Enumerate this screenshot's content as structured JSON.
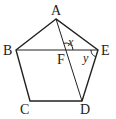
{
  "diagram": {
    "type": "geometry",
    "shape": "pentagon",
    "vertices": [
      {
        "label": "A",
        "x": 56,
        "y": 19
      },
      {
        "label": "B",
        "x": 16,
        "y": 50
      },
      {
        "label": "C",
        "x": 30,
        "y": 101
      },
      {
        "label": "D",
        "x": 82,
        "y": 101
      },
      {
        "label": "E",
        "x": 98,
        "y": 50
      }
    ],
    "intersection": {
      "label": "F",
      "x": 66,
      "y": 50
    },
    "segments": [
      "AB",
      "BC",
      "CD",
      "DE",
      "EA",
      "BE",
      "AD"
    ],
    "angles": [
      {
        "label": "x",
        "at": "F",
        "between": [
          "FA",
          "FE"
        ]
      },
      {
        "label": "y",
        "at": "E",
        "between": [
          "EB",
          "ED"
        ]
      }
    ]
  },
  "labels": {
    "A": "A",
    "B": "B",
    "C": "C",
    "D": "D",
    "E": "E",
    "F": "F",
    "x": "x",
    "y": "y"
  }
}
